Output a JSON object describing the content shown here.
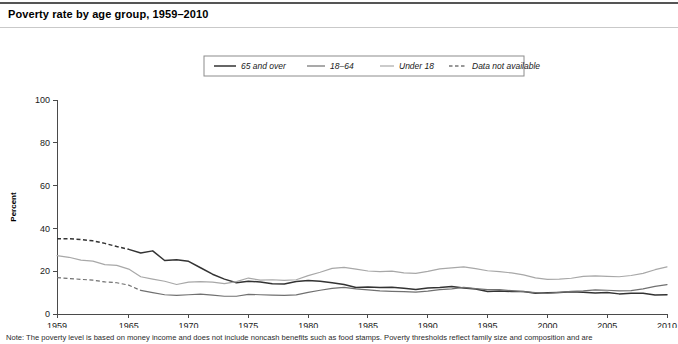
{
  "chart_title": "Poverty rate by age group, 1959–2010",
  "footnote": "Note: The poverty level is based on money income and does not include noncash benefits such as food stamps. Poverty thresholds reflect family size and composition and are",
  "legend": {
    "items": [
      {
        "label": "65 and over",
        "key": "65_and_over",
        "style": "solid-dark",
        "color": "#333333"
      },
      {
        "label": "18–64",
        "key": "18_64",
        "style": "solid-mid",
        "color": "#707070"
      },
      {
        "label": "Under 18",
        "key": "under_18",
        "style": "solid-light",
        "color": "#a8a8a8"
      },
      {
        "label": "Data not available",
        "key": "not_available",
        "style": "dashed",
        "color": "#333333"
      }
    ]
  },
  "chart_data": {
    "type": "line",
    "title": "Poverty rate by age group, 1959–2010",
    "xlabel": "",
    "ylabel": "Percent",
    "xlim": [
      1959,
      2010
    ],
    "ylim": [
      0,
      100
    ],
    "yticks": [
      0,
      20,
      40,
      60,
      80,
      100
    ],
    "xticks": [
      1959,
      1965,
      1970,
      1975,
      1980,
      1985,
      1990,
      1995,
      2000,
      2005,
      2010
    ],
    "grid": false,
    "legend_position": "top-center",
    "x": [
      1959,
      1960,
      1961,
      1962,
      1963,
      1964,
      1965,
      1966,
      1967,
      1968,
      1969,
      1970,
      1971,
      1972,
      1973,
      1974,
      1975,
      1976,
      1977,
      1978,
      1979,
      1980,
      1981,
      1982,
      1983,
      1984,
      1985,
      1986,
      1987,
      1988,
      1989,
      1990,
      1991,
      1992,
      1993,
      1994,
      1995,
      1996,
      1997,
      1998,
      1999,
      2000,
      2001,
      2002,
      2003,
      2004,
      2005,
      2006,
      2007,
      2008,
      2009,
      2010
    ],
    "series": [
      {
        "name": "65 and over",
        "color": "#333333",
        "width": 1.5,
        "dashed_until": 1965,
        "values": [
          35.2,
          35.2,
          34.8,
          34.2,
          33.0,
          31.5,
          30.2,
          28.5,
          29.5,
          25.0,
          25.3,
          24.6,
          21.6,
          18.6,
          16.3,
          14.6,
          15.3,
          15.0,
          14.1,
          14.0,
          15.2,
          15.7,
          15.3,
          14.6,
          13.8,
          12.4,
          12.6,
          12.4,
          12.5,
          12.0,
          11.4,
          12.2,
          12.4,
          12.9,
          12.2,
          11.7,
          10.5,
          10.8,
          10.5,
          10.5,
          9.7,
          9.9,
          10.1,
          10.4,
          10.2,
          9.8,
          10.1,
          9.4,
          9.7,
          9.7,
          8.9,
          9.0
        ]
      },
      {
        "name": "18–64",
        "color": "#707070",
        "width": 1.2,
        "dashed_until": 1966,
        "values": [
          17.0,
          16.6,
          16.2,
          15.8,
          15.0,
          14.6,
          13.5,
          11.0,
          10.0,
          9.0,
          8.7,
          9.0,
          9.3,
          8.8,
          8.3,
          8.3,
          9.2,
          9.0,
          8.8,
          8.7,
          8.9,
          10.1,
          11.1,
          12.0,
          12.4,
          11.7,
          11.3,
          10.8,
          10.6,
          10.5,
          10.2,
          10.7,
          11.4,
          11.7,
          12.4,
          11.9,
          11.4,
          11.4,
          10.9,
          10.5,
          10.0,
          9.6,
          10.1,
          10.6,
          10.8,
          11.3,
          11.1,
          10.8,
          10.9,
          11.7,
          12.9,
          13.7
        ]
      },
      {
        "name": "Under 18",
        "color": "#a8a8a8",
        "width": 1.2,
        "dashed_until": null,
        "values": [
          27.3,
          26.5,
          25.2,
          24.7,
          23.1,
          22.7,
          21.0,
          17.4,
          16.3,
          15.3,
          13.8,
          14.9,
          15.1,
          14.9,
          14.2,
          15.1,
          16.8,
          15.8,
          16.0,
          15.7,
          16.0,
          17.9,
          19.5,
          21.3,
          21.8,
          21.0,
          20.1,
          19.8,
          20.0,
          19.2,
          19.0,
          19.9,
          21.1,
          21.6,
          22.0,
          21.2,
          20.2,
          19.8,
          19.2,
          18.3,
          16.9,
          16.2,
          16.3,
          16.7,
          17.6,
          17.8,
          17.6,
          17.4,
          18.0,
          19.0,
          20.7,
          22.0
        ]
      }
    ]
  }
}
